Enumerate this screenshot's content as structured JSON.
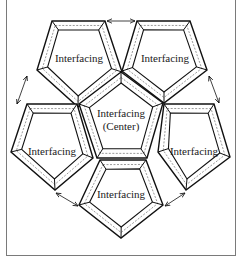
{
  "diagram": {
    "colors": {
      "stroke": "#111111",
      "seam": "#555555",
      "frame": "#7a7a7a",
      "background": "#ffffff"
    },
    "pieces": [
      {
        "id": "top-left",
        "label": "Interfacing",
        "label_x": 70,
        "label_y": 62,
        "points": [
          [
            52,
            21
          ],
          [
            105,
            21
          ],
          [
            122,
            72
          ],
          [
            78,
            107
          ],
          [
            37,
            70
          ]
        ]
      },
      {
        "id": "top-right",
        "label": "Interfacing",
        "label_x": 156,
        "label_y": 62,
        "points": [
          [
            137,
            21
          ],
          [
            190,
            21
          ],
          [
            207,
            70
          ],
          [
            164,
            103
          ],
          [
            122,
            71
          ]
        ]
      },
      {
        "id": "left",
        "label": "Interfacing",
        "label_x": 52,
        "label_y": 155,
        "points": [
          [
            27,
            104
          ],
          [
            77,
            104
          ],
          [
            93,
            158
          ],
          [
            55,
            190
          ],
          [
            11,
            152
          ]
        ]
      },
      {
        "id": "right",
        "label": "Interfacing",
        "label_x": 194,
        "label_y": 155,
        "points": [
          [
            164,
            104
          ],
          [
            214,
            104
          ],
          [
            230,
            157
          ],
          [
            186,
            190
          ],
          [
            158,
            152
          ]
        ]
      },
      {
        "id": "bottom",
        "label": "Interfacing",
        "label_x": 121,
        "label_y": 198,
        "points": [
          [
            100,
            160
          ],
          [
            146,
            160
          ],
          [
            163,
            205
          ],
          [
            121,
            238
          ],
          [
            79,
            205
          ]
        ]
      },
      {
        "id": "center",
        "label": "Interfacing",
        "label2": "(Center)",
        "label_x": 121,
        "label_y": 118,
        "points": [
          [
            121,
            72
          ],
          [
            163,
            103
          ],
          [
            147,
            158
          ],
          [
            97,
            158
          ],
          [
            79,
            104
          ]
        ]
      }
    ],
    "arrows": [
      {
        "id": "arrow-top",
        "from": [
          107,
          21
        ],
        "to": [
          135,
          21
        ]
      },
      {
        "id": "arrow-left",
        "from": [
          27,
          76
        ],
        "to": [
          17,
          104
        ]
      },
      {
        "id": "arrow-right",
        "from": [
          209,
          76
        ],
        "to": [
          219,
          103
        ]
      },
      {
        "id": "arrow-bottom-left",
        "from": [
          56,
          193
        ],
        "to": [
          78,
          206
        ]
      },
      {
        "id": "arrow-bottom-right",
        "from": [
          185,
          193
        ],
        "to": [
          165,
          206
        ]
      }
    ]
  },
  "labels": {
    "top_left": "Interfacing",
    "top_right": "Interfacing",
    "left": "Interfacing",
    "right": "Interfacing",
    "bottom": "Interfacing",
    "center_line1": "Interfacing",
    "center_line2": "(Center)"
  }
}
